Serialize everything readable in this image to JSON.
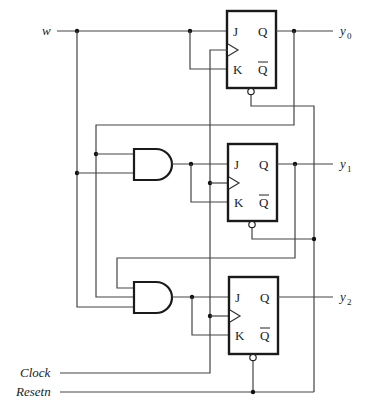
{
  "diagram": {
    "type": "circuit-schematic",
    "inputs": {
      "w": "w",
      "clock": "Clock",
      "resetn": "Resetn"
    },
    "outputs": [
      {
        "name": "y",
        "sub": "0"
      },
      {
        "name": "y",
        "sub": "1"
      },
      {
        "name": "y",
        "sub": "2"
      }
    ],
    "flipflops": [
      {
        "id": "ff0",
        "j": "J",
        "k": "K",
        "q": "Q",
        "qbar": "Q"
      },
      {
        "id": "ff1",
        "j": "J",
        "k": "K",
        "q": "Q",
        "qbar": "Q"
      },
      {
        "id": "ff2",
        "j": "J",
        "k": "K",
        "q": "Q",
        "qbar": "Q"
      }
    ],
    "gates": [
      {
        "id": "and1",
        "type": "AND",
        "inputs": [
          "w",
          "y0"
        ],
        "output": "ff1.J/K"
      },
      {
        "id": "and2",
        "type": "AND",
        "inputs": [
          "y1",
          "y0",
          "w"
        ],
        "output": "ff2.J/K"
      }
    ],
    "colors": {
      "wire": "#444444",
      "component": "#1a1a1a",
      "background": "#ffffff"
    }
  }
}
